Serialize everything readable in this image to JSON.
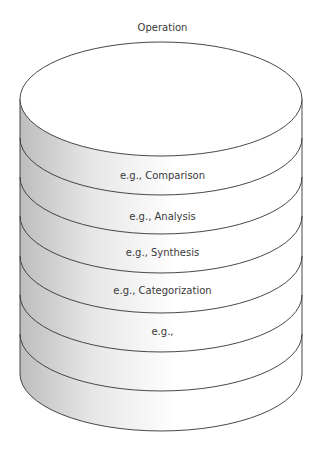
{
  "diagram": {
    "title": "Operation",
    "layers": [
      {
        "label": "e.g., Comparison"
      },
      {
        "label": "e.g., Analysis"
      },
      {
        "label": "e.g., Synthesis"
      },
      {
        "label": "e.g., Categorization"
      },
      {
        "label": "e.g.,"
      },
      {
        "label": ""
      },
      {
        "label": ""
      }
    ],
    "colors": {
      "stroke": "#333333",
      "top_fill": "#ffffff",
      "side_shade": "#c8c8c8"
    }
  }
}
